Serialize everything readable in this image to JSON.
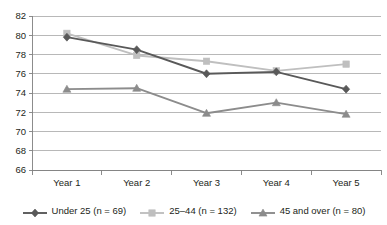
{
  "chart_data": {
    "type": "line",
    "title": "",
    "subtitle": "",
    "xlabel": "",
    "ylabel": "",
    "categories": [
      "Year 1",
      "Year 2",
      "Year 3",
      "Year 4",
      "Year 5"
    ],
    "ylim": [
      66,
      82
    ],
    "yticks": [
      66,
      68,
      70,
      72,
      74,
      76,
      78,
      80,
      82
    ],
    "ytick_labels": [
      "66",
      "68",
      "70",
      "72",
      "74",
      "76",
      "78",
      "80",
      "82"
    ],
    "grid": "horizontal",
    "legend_position": "bottom",
    "series": [
      {
        "name": "Under 25 (n = 69)",
        "marker": "diamond",
        "color": "#595959",
        "values": [
          79.8,
          78.5,
          76.0,
          76.2,
          74.4
        ]
      },
      {
        "name": "25–44 (n = 132)",
        "marker": "square",
        "color": "#bfbfbf",
        "values": [
          80.2,
          77.9,
          77.3,
          76.3,
          77.0
        ]
      },
      {
        "name": "45 and over (n = 80)",
        "marker": "triangle",
        "color": "#8c8c8c",
        "values": [
          74.4,
          74.5,
          71.9,
          73.0,
          71.8
        ]
      }
    ]
  },
  "legend": {
    "items": [
      {
        "label": "Under 25 (n = 69)"
      },
      {
        "label": "25–44 (n = 132)"
      },
      {
        "label": "45 and over (n = 80)"
      }
    ]
  },
  "colors": {
    "series_under25": "#595959",
    "series_25_44": "#bfbfbf",
    "series_45_over": "#8c8c8c",
    "gridline": "#a6a6a6",
    "axis": "#808080",
    "text": "#231f20",
    "background": "#ffffff"
  }
}
